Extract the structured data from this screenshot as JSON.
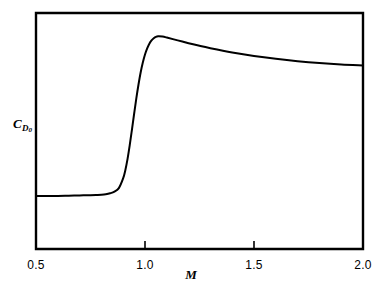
{
  "figure": {
    "background_color": "#ffffff",
    "line_color": "#000000",
    "axis_color": "#000000"
  },
  "axes": {
    "frame": {
      "left": 36,
      "top": 13,
      "right": 363,
      "bottom": 249
    },
    "x": {
      "label": "M",
      "min": 0.5,
      "max": 2.0,
      "ticks": [
        0.5,
        1.0,
        1.5,
        2.0
      ],
      "tick_labels": [
        "0.5",
        "1.0",
        "1.5",
        "2.0"
      ],
      "tick_direction": "in"
    },
    "y": {
      "label_main": "C",
      "label_sub": "D",
      "label_subsub": "0",
      "label_text": "CD0",
      "ticks": [],
      "tick_labels": []
    }
  },
  "chart_data": {
    "type": "line",
    "title": "",
    "subtitle": "",
    "xlabel": "M",
    "ylabel": "CD0",
    "xlim": [
      0.5,
      2.0
    ],
    "ylim": [
      0.0,
      1.0
    ],
    "grid": false,
    "legend": null,
    "annotations": [],
    "series": [
      {
        "name": "Zero-lift drag coefficient",
        "color": "#000000",
        "line_width": 2.0,
        "x": [
          0.5,
          0.55,
          0.6,
          0.65,
          0.7,
          0.75,
          0.78,
          0.8,
          0.82,
          0.84,
          0.86,
          0.88,
          0.9,
          0.91,
          0.92,
          0.93,
          0.94,
          0.95,
          0.96,
          0.97,
          0.98,
          0.99,
          1.0,
          1.01,
          1.02,
          1.03,
          1.04,
          1.05,
          1.06,
          1.08,
          1.1,
          1.15,
          1.2,
          1.25,
          1.3,
          1.4,
          1.5,
          1.6,
          1.7,
          1.8,
          1.9,
          2.0
        ],
        "y": [
          0.225,
          0.225,
          0.225,
          0.226,
          0.227,
          0.228,
          0.229,
          0.23,
          0.232,
          0.236,
          0.243,
          0.258,
          0.3,
          0.335,
          0.382,
          0.44,
          0.505,
          0.572,
          0.637,
          0.696,
          0.748,
          0.79,
          0.824,
          0.85,
          0.87,
          0.884,
          0.893,
          0.899,
          0.901,
          0.9,
          0.896,
          0.884,
          0.872,
          0.861,
          0.851,
          0.833,
          0.818,
          0.806,
          0.796,
          0.788,
          0.782,
          0.778
        ]
      }
    ]
  }
}
